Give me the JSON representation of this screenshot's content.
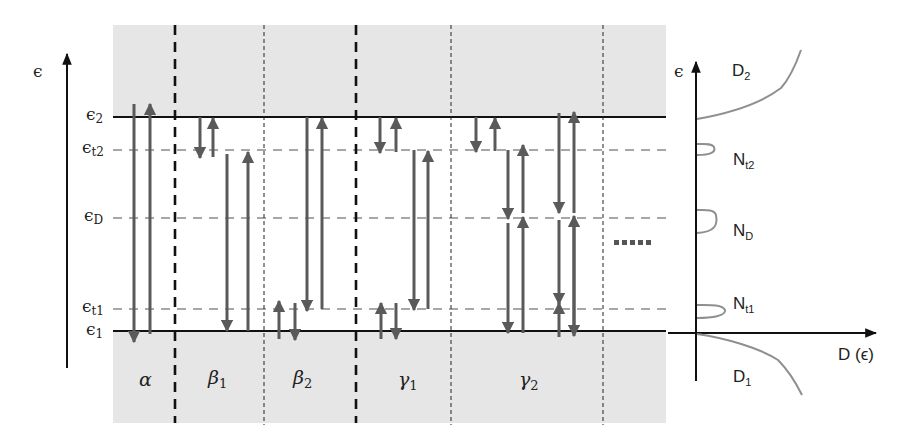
{
  "figure": {
    "type": "energy-level diagram with density of states",
    "colors": {
      "band_shading": "#e6e6e6",
      "band_edge": "#111111",
      "level_dash": "#8a8a8a",
      "arrow": "#5a5a5a",
      "dos_curve": "#8f8f8f",
      "axis": "#111111"
    }
  },
  "left_axis": {
    "symbol": "ϵ"
  },
  "levels": [
    {
      "id": "e2",
      "symbol": "ϵ",
      "sub": "2",
      "style": "solid"
    },
    {
      "id": "et2",
      "symbol": "ϵ",
      "sub": "t2",
      "style": "dashed"
    },
    {
      "id": "eD",
      "symbol": "ϵ",
      "sub": "D",
      "style": "dashed"
    },
    {
      "id": "et1",
      "symbol": "ϵ",
      "sub": "t1",
      "style": "dashed"
    },
    {
      "id": "e1",
      "symbol": "ϵ",
      "sub": "1",
      "style": "solid"
    }
  ],
  "processes": [
    {
      "id": "alpha",
      "greek": "α",
      "sub": ""
    },
    {
      "id": "beta1",
      "greek": "β",
      "sub": "1"
    },
    {
      "id": "beta2",
      "greek": "β",
      "sub": "2"
    },
    {
      "id": "gamma1",
      "greek": "γ",
      "sub": "1"
    },
    {
      "id": "gamma2",
      "greek": "γ",
      "sub": "2"
    }
  ],
  "continuation": "......",
  "dos_panel": {
    "y_axis_symbol": "ϵ",
    "x_axis_label": "D (ϵ)",
    "curves": [
      {
        "id": "D2",
        "name": "D",
        "sub": "2"
      },
      {
        "id": "Nt2",
        "name": "N",
        "sub": "t2"
      },
      {
        "id": "ND",
        "name": "N",
        "sub": "D"
      },
      {
        "id": "Nt1",
        "name": "N",
        "sub": "t1"
      },
      {
        "id": "D1",
        "name": "D",
        "sub": "1"
      }
    ]
  }
}
